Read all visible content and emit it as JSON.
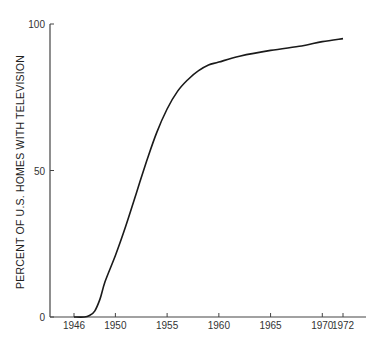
{
  "chart_data": {
    "type": "line",
    "title": "",
    "xlabel": "",
    "ylabel": "PERCENT OF U.S. HOMES WITH TELEVISION",
    "xlim": [
      1944.6,
      1974
    ],
    "ylim": [
      0,
      100
    ],
    "x_ticks": [
      1946,
      1950,
      1955,
      1960,
      1965,
      1970,
      1972
    ],
    "y_ticks": [
      0,
      50,
      100
    ],
    "grid": false,
    "legend": null,
    "series": [
      {
        "name": "Percent of U.S. homes with television",
        "x": [
          1946,
          1947,
          1947.5,
          1948,
          1948.5,
          1949,
          1950,
          1951,
          1952,
          1953,
          1954,
          1955,
          1956,
          1957,
          1958,
          1959,
          1960,
          1962,
          1965,
          1968,
          1970,
          1972
        ],
        "y": [
          0,
          0,
          0.5,
          2,
          6,
          12,
          21,
          31,
          42,
          53,
          63,
          71,
          77,
          81,
          84,
          86,
          87,
          89,
          91,
          92.5,
          94,
          95
        ]
      }
    ]
  },
  "colors": {
    "line": "#1a1a1a",
    "axis": "#444444"
  }
}
